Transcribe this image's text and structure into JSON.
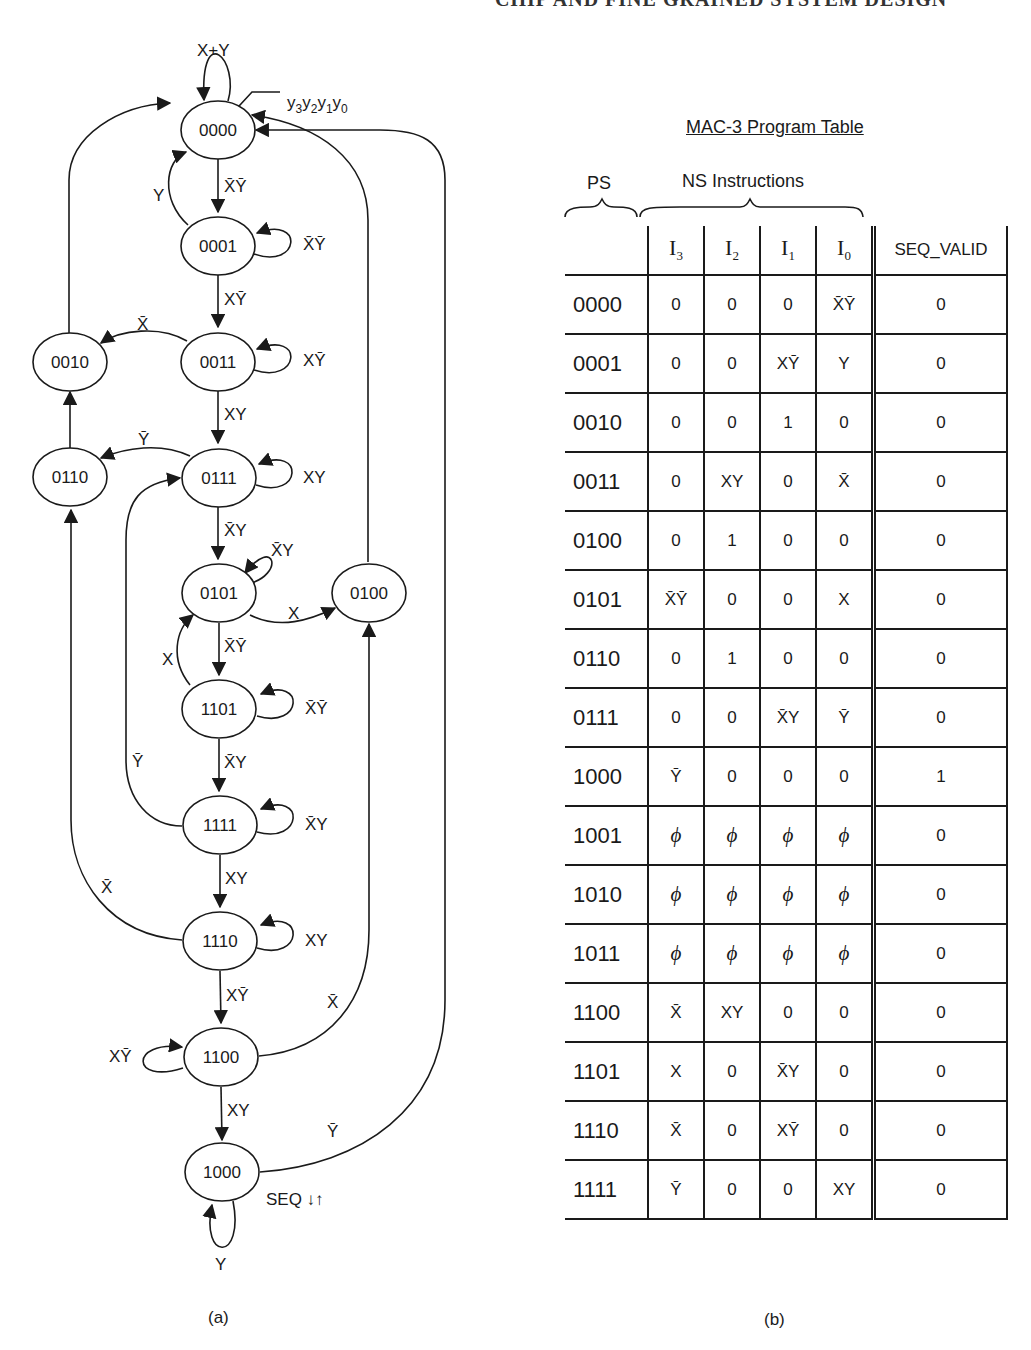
{
  "running_head": "CHIP AND FINE GRAINED SYSTEM DESIGN",
  "diagram": {
    "caption": "(a)",
    "state_code_label": "y3y2y1y0",
    "states": [
      "0000",
      "0001",
      "0011",
      "0010",
      "0111",
      "0110",
      "0101",
      "0100",
      "1101",
      "1111",
      "1110",
      "1100",
      "1000"
    ],
    "output_note": "SEQ ↓↑",
    "transitions": [
      {
        "from": "0000",
        "to": "0000",
        "cond": "X+Y"
      },
      {
        "from": "0000",
        "to": "0001",
        "cond": "X̄Ȳ"
      },
      {
        "from": "0001",
        "to": "0000",
        "cond": "Y"
      },
      {
        "from": "0001",
        "to": "0001",
        "cond": "X̄Ȳ"
      },
      {
        "from": "0001",
        "to": "0011",
        "cond": "XȲ"
      },
      {
        "from": "0011",
        "to": "0010",
        "cond": "X̄"
      },
      {
        "from": "0011",
        "to": "0011",
        "cond": "XȲ"
      },
      {
        "from": "0011",
        "to": "0111",
        "cond": "XY"
      },
      {
        "from": "0010",
        "to": "0000",
        "cond": "1"
      },
      {
        "from": "0111",
        "to": "0110",
        "cond": "Ȳ"
      },
      {
        "from": "0111",
        "to": "0111",
        "cond": "XY"
      },
      {
        "from": "0111",
        "to": "0101",
        "cond": "X̄Y"
      },
      {
        "from": "0110",
        "to": "0010",
        "cond": "1"
      },
      {
        "from": "0101",
        "to": "0101",
        "cond": "X̄Y"
      },
      {
        "from": "0101",
        "to": "0100",
        "cond": "X"
      },
      {
        "from": "0101",
        "to": "1101",
        "cond": "X̄Ȳ"
      },
      {
        "from": "0100",
        "to": "0000",
        "cond": "1"
      },
      {
        "from": "1101",
        "to": "0101",
        "cond": "X"
      },
      {
        "from": "1101",
        "to": "1101",
        "cond": "X̄Ȳ"
      },
      {
        "from": "1101",
        "to": "1111",
        "cond": "X̄Y"
      },
      {
        "from": "1111",
        "to": "0111",
        "cond": "Ȳ"
      },
      {
        "from": "1111",
        "to": "1111",
        "cond": "X̄Y"
      },
      {
        "from": "1111",
        "to": "1110",
        "cond": "XY"
      },
      {
        "from": "1110",
        "to": "0110",
        "cond": "X̄"
      },
      {
        "from": "1110",
        "to": "1110",
        "cond": "XY"
      },
      {
        "from": "1110",
        "to": "1100",
        "cond": "XȲ"
      },
      {
        "from": "1100",
        "to": "1100",
        "cond": "XȲ"
      },
      {
        "from": "1100",
        "to": "0100",
        "cond": "X̄"
      },
      {
        "from": "1100",
        "to": "1000",
        "cond": "XY"
      },
      {
        "from": "1000",
        "to": "1000",
        "cond": "Y"
      },
      {
        "from": "1000",
        "to": "0000",
        "cond": "Ȳ"
      }
    ]
  },
  "table": {
    "title": "MAC-3 Program Table",
    "group_labels": {
      "ps": "PS",
      "ns": "NS Instructions"
    },
    "columns": [
      "",
      "I3",
      "I2",
      "I1",
      "I0",
      "SEQ_VALID"
    ],
    "rows": [
      [
        "0000",
        "0",
        "0",
        "0",
        "X̄Ȳ",
        "0"
      ],
      [
        "0001",
        "0",
        "0",
        "XȲ",
        "Y",
        "0"
      ],
      [
        "0010",
        "0",
        "0",
        "1",
        "0",
        "0"
      ],
      [
        "0011",
        "0",
        "XY",
        "0",
        "X̄",
        "0"
      ],
      [
        "0100",
        "0",
        "1",
        "0",
        "0",
        "0"
      ],
      [
        "0101",
        "X̄Ȳ",
        "0",
        "0",
        "X",
        "0"
      ],
      [
        "0110",
        "0",
        "1",
        "0",
        "0",
        "0"
      ],
      [
        "0111",
        "0",
        "0",
        "X̄Y",
        "Ȳ",
        "0"
      ],
      [
        "1000",
        "Ȳ",
        "0",
        "0",
        "0",
        "1"
      ],
      [
        "1001",
        "ϕ",
        "ϕ",
        "ϕ",
        "ϕ",
        "0"
      ],
      [
        "1010",
        "ϕ",
        "ϕ",
        "ϕ",
        "ϕ",
        "0"
      ],
      [
        "1011",
        "ϕ",
        "ϕ",
        "ϕ",
        "ϕ",
        "0"
      ],
      [
        "1100",
        "X̄",
        "XY",
        "0",
        "0",
        "0"
      ],
      [
        "1101",
        "X",
        "0",
        "X̄Y",
        "0",
        "0"
      ],
      [
        "1110",
        "X̄",
        "0",
        "XȲ",
        "0",
        "0"
      ],
      [
        "1111",
        "Ȳ",
        "0",
        "0",
        "XY",
        "0"
      ]
    ],
    "caption": "(b)"
  }
}
